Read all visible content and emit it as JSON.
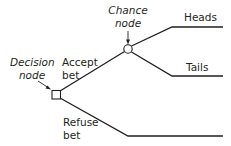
{
  "diagram": {
    "type": "decision-tree",
    "nodes": {
      "decision": {
        "label_line1": "Decision",
        "label_line2": "node",
        "shape": "square"
      },
      "chance": {
        "label_line1": "Chance",
        "label_line2": "node",
        "shape": "circle"
      }
    },
    "branches": {
      "accept": {
        "label_line1": "Accept",
        "label_line2": "bet"
      },
      "refuse": {
        "label_line1": "Refuse",
        "label_line2": "bet"
      },
      "heads": {
        "label": "Heads"
      },
      "tails": {
        "label": "Tails"
      }
    },
    "colors": {
      "line": "#231f20",
      "background": "#ffffff"
    }
  }
}
